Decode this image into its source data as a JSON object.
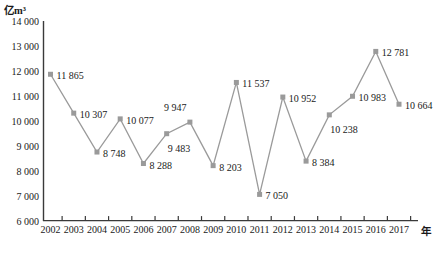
{
  "chart_data": {
    "type": "line",
    "title": "",
    "subtitle": "",
    "xlabel": "年",
    "ylabel": "亿m³",
    "ylim": [
      6000,
      14000
    ],
    "ytick_step": 1000,
    "ytick_labels": [
      "14 000",
      "13 000",
      "12 000",
      "11 000",
      "10 000",
      "9 000",
      "8 000",
      "7 000",
      "6 000"
    ],
    "ytick_values": [
      14000,
      13000,
      12000,
      11000,
      10000,
      9000,
      8000,
      7000,
      6000
    ],
    "grid": false,
    "legend": "none",
    "marker": "square",
    "categories": [
      "2002",
      "2003",
      "2004",
      "2005",
      "2006",
      "2007",
      "2008",
      "2009",
      "2010",
      "2011",
      "2012",
      "2013",
      "2014",
      "2015",
      "2016",
      "2017"
    ],
    "values": [
      11865,
      10307,
      8748,
      10077,
      8288,
      9483,
      9947,
      8203,
      11537,
      7050,
      10952,
      8384,
      10238,
      10983,
      12781,
      10664
    ],
    "data_labels": [
      "11 865",
      "10 307",
      "8 748",
      "10 077",
      "8 288",
      "9 483",
      "9 947",
      "8 203",
      "11 537",
      "7 050",
      "10 952",
      "8 384",
      "10 238",
      "10 983",
      "12 781",
      "10 664"
    ],
    "label_placement": [
      "right",
      "right",
      "right",
      "right",
      "right",
      "below-right",
      "above-left",
      "right",
      "right",
      "right",
      "right",
      "right",
      "below-right",
      "right",
      "right",
      "right"
    ],
    "series_color": "#9a9a9a",
    "axis_color": "#3a3a3a",
    "text_color": "#1a1a1a"
  }
}
